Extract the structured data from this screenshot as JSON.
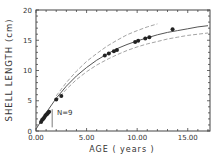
{
  "chart_data": {
    "type": "scatter",
    "title": "",
    "xlabel": "AGE ( years )",
    "ylabel": "SHELL LENGTH (cm)",
    "xlim": [
      0,
      17.2
    ],
    "ylim": [
      0,
      20
    ],
    "x_ticks": [
      "0.00",
      "5.00",
      "10.00",
      "15.00"
    ],
    "y_ticks": [
      "0",
      "5",
      "10",
      "15",
      "20"
    ],
    "grid": false,
    "annotation": "N=9",
    "series": [
      {
        "name": "observed",
        "style": "points",
        "x": [
          0.5,
          0.6,
          0.7,
          0.8,
          0.9,
          1.0,
          1.1,
          1.2,
          1.3,
          2.0,
          2.5,
          6.8,
          7.2,
          7.7,
          8.0,
          9.8,
          10.1,
          10.8,
          11.2,
          13.5
        ],
        "y": [
          1.5,
          1.8,
          2.0,
          2.2,
          2.5,
          2.7,
          2.8,
          3.0,
          3.2,
          5.2,
          5.8,
          12.5,
          12.8,
          13.2,
          13.4,
          14.7,
          14.9,
          15.3,
          15.5,
          16.8
        ]
      },
      {
        "name": "fitted growth curve",
        "style": "solid",
        "x": [
          0,
          1,
          2,
          3,
          4,
          5,
          6,
          7,
          8,
          9,
          10,
          11,
          12,
          13,
          14,
          15,
          16,
          17
        ],
        "y": [
          0.3,
          3.0,
          5.4,
          7.4,
          9.1,
          10.5,
          11.7,
          12.7,
          13.6,
          14.3,
          14.9,
          15.4,
          15.9,
          16.3,
          16.6,
          16.9,
          17.2,
          17.4
        ]
      },
      {
        "name": "upper confidence bound",
        "style": "dashed",
        "x": [
          2,
          3,
          4,
          5,
          6,
          7,
          8,
          9,
          10,
          11,
          12
        ],
        "y": [
          5.8,
          8.0,
          9.9,
          11.5,
          12.8,
          14.0,
          15.0,
          15.9,
          16.6,
          17.2,
          17.7
        ]
      },
      {
        "name": "lower confidence bound",
        "style": "dashed",
        "x": [
          2,
          3,
          4,
          5,
          6,
          7,
          8,
          9,
          10,
          11,
          12,
          13,
          14,
          15,
          16,
          17
        ],
        "y": [
          5.0,
          6.9,
          8.5,
          9.8,
          10.9,
          11.8,
          12.6,
          13.3,
          13.9,
          14.4,
          14.8,
          15.2,
          15.5,
          15.8,
          16.0,
          16.2
        ]
      }
    ]
  }
}
